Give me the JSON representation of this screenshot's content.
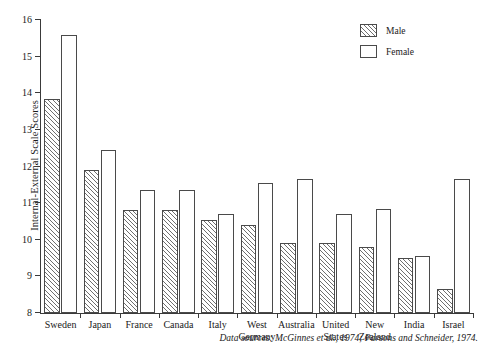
{
  "chart_data": {
    "type": "bar",
    "title": "",
    "xlabel": "",
    "ylabel": "Internal-External Scale Scores",
    "ylim": [
      8,
      16
    ],
    "yticks": [
      8,
      9,
      10,
      11,
      12,
      13,
      14,
      15,
      16
    ],
    "ytick_labels": [
      "8",
      "9",
      "10",
      "11",
      "12",
      "13",
      "14",
      "15",
      "16"
    ],
    "grid": false,
    "legend_position": "top-right",
    "categories": [
      "Sweden",
      "Japan",
      "France",
      "Canada",
      "Italy",
      "West\nGermany",
      "Australia",
      "United\nStates",
      "New\nZealand",
      "India",
      "Israel"
    ],
    "series": [
      {
        "name": "Male",
        "fill": "hatched",
        "values": [
          13.85,
          11.9,
          10.8,
          10.8,
          10.55,
          10.4,
          9.9,
          9.9,
          9.8,
          9.5,
          8.65
        ]
      },
      {
        "name": "Female",
        "fill": "white",
        "values": [
          15.6,
          12.45,
          11.35,
          11.35,
          10.7,
          11.55,
          11.65,
          10.7,
          10.85,
          9.55,
          11.65
        ]
      }
    ],
    "caption": "Data sources: McGinnes et al., 1974; Parsons and Schneider, 1974.",
    "colors": {
      "axis": "#3a3a3a",
      "bar_outline": "#4a4a4a",
      "hatch": "#6f6f6f",
      "background": "#ffffff"
    }
  }
}
